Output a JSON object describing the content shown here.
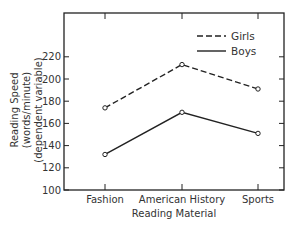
{
  "chart_data": {
    "type": "line",
    "title": "",
    "xlabel": "Reading Material",
    "ylabel": "Reading Speed (words/minute)",
    "ylabel_sub": "(dependent variable)",
    "categories": [
      "Fashion",
      "American History",
      "Sports"
    ],
    "series": [
      {
        "name": "Girls",
        "style": "dashed",
        "values": [
          174,
          213,
          191
        ]
      },
      {
        "name": "Boys",
        "style": "solid",
        "values": [
          132,
          170,
          151
        ]
      }
    ],
    "yticks": [
      100,
      120,
      140,
      160,
      180,
      200,
      220
    ],
    "ylim": [
      100,
      250
    ],
    "grid": false,
    "legend_position": "upper right",
    "colors": {
      "line": "#222222",
      "axis": "#222222"
    }
  }
}
